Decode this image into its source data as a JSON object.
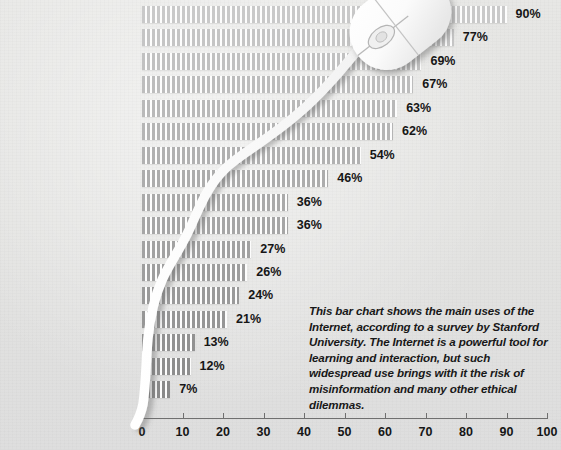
{
  "chart_data": {
    "type": "bar",
    "orientation": "horizontal",
    "title": "",
    "xlabel": "",
    "ylabel": "",
    "xlim": [
      0,
      100
    ],
    "xticks": [
      "0",
      "10",
      "20",
      "30",
      "40",
      "50",
      "60",
      "70",
      "80",
      "90",
      "100"
    ],
    "grid": false,
    "legend": null,
    "value_suffix": "%",
    "categories": [
      "Email",
      "General information",
      "Surfing",
      "Reading",
      "Hobbies",
      "Product information",
      "Travel information",
      "Work/business",
      "Entertainment/games",
      "Buying",
      "Stock quotes",
      "Job search",
      "Chat rooms",
      "Homework",
      "Auctions",
      "Banking",
      "Trading stocks"
    ],
    "values": [
      90,
      77,
      69,
      67,
      63,
      62,
      54,
      46,
      36,
      36,
      27,
      26,
      24,
      21,
      13,
      12,
      7
    ],
    "value_labels": [
      "90%",
      "77%",
      "69%",
      "67%",
      "63%",
      "62%",
      "54%",
      "46%",
      "36%",
      "36%",
      "27%",
      "26%",
      "24%",
      "21%",
      "13%",
      "12%",
      "7%"
    ]
  },
  "caption": {
    "text": "This bar chart shows the main uses of the Internet, according to a survey by Stanford University. The Internet is a powerful tool for learning and interaction, but such widespread use brings with it the risk of misinformation and many other ethical dilemmas."
  },
  "decoration": {
    "mouse_icon": "computer-mouse-icon",
    "cable_icon": "mouse-cable-icon"
  },
  "colors": {
    "background": "#e5e5e3",
    "bar_light": "#c9c9c9",
    "bar_dark": "#8d8d8d",
    "text": "#161616",
    "axis": "#6f6f6f",
    "mouse": "#fdfdfd"
  }
}
